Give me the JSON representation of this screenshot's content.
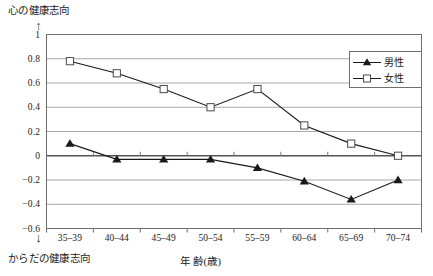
{
  "chart_data": {
    "type": "line",
    "title": "",
    "xlabel": "年 齢(歳)",
    "ylabel": "",
    "ylabel_top": "心の健康志向",
    "ylabel_bottom": "からだの健康志向",
    "categories": [
      "35-39",
      "40-44",
      "45-49",
      "50-54",
      "55-59",
      "60-64",
      "65-69",
      "70-74"
    ],
    "yticks": [
      "1",
      "0.8",
      "0.6",
      "0.4",
      "0.2",
      "0",
      "-0.2",
      "-0.4",
      "-0.6"
    ],
    "ytick_values": [
      1,
      0.8,
      0.6,
      0.4,
      0.2,
      0,
      -0.2,
      -0.4,
      -0.6
    ],
    "ylim": [
      -0.6,
      1
    ],
    "grid": true,
    "legend_position": "upper-right",
    "series": [
      {
        "name": "男性",
        "marker": "filled-triangle",
        "color": "#1a1a1a",
        "values": [
          0.1,
          -0.03,
          -0.03,
          -0.03,
          -0.1,
          -0.21,
          -0.36,
          -0.2
        ]
      },
      {
        "name": "女性",
        "marker": "open-square",
        "color": "#1a1a1a",
        "values": [
          0.78,
          0.68,
          0.55,
          0.4,
          0.55,
          0.25,
          0.1,
          0.0
        ]
      }
    ]
  },
  "axes": {
    "top_arrow": "↑",
    "bottom_arrow": "↓"
  },
  "legend": {
    "items": [
      {
        "label": "男性"
      },
      {
        "label": "女性"
      }
    ]
  }
}
